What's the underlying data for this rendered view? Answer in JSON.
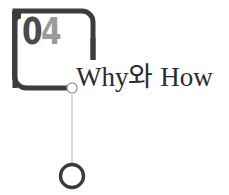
{
  "slide": {
    "section_number": {
      "full": "04",
      "first_digit": "0",
      "second_digit": "4"
    },
    "heading": "Why와 How",
    "colors": {
      "bracket": "#3d3d3d",
      "number_dark": "#4b4b4b",
      "number_light": "#9b9b9b",
      "heading": "#2b2b2b",
      "connector_line": "#b9b9b9",
      "small_node_stroke": "#8d8d8d",
      "small_node_fill": "#ffffff",
      "large_node_stroke": "#3a3a3a",
      "background": "#ffffff"
    },
    "shapes": {
      "bracket_name": "open-bracket-frame",
      "connector_name": "vertical-connector-line",
      "small_node_name": "small-circle-node",
      "large_node_name": "large-circle-node"
    }
  }
}
